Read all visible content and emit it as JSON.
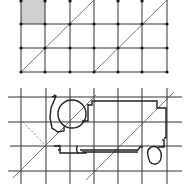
{
  "figure": {
    "width": 192,
    "height": 194,
    "background": "#ffffff",
    "stroke": "#2a2a2a",
    "thin_stroke": "#444444",
    "shade_fill": "#d0d0d0",
    "node_fill": "#1a1a1a"
  },
  "top_grid": {
    "x": [
      21,
      45,
      70,
      94,
      118,
      142,
      167
    ],
    "y": [
      0,
      24,
      48,
      72
    ],
    "shaded_cell": {
      "col": 0,
      "row": 0
    },
    "diagonals": [
      {
        "x1": 21,
        "y1": 72,
        "x2": 94,
        "y2": 0
      },
      {
        "x1": 94,
        "y1": 72,
        "x2": 167,
        "y2": 0
      }
    ]
  },
  "bottom_grid": {
    "x": [
      21,
      46,
      70,
      94,
      118,
      142,
      167
    ],
    "y": [
      97,
      122,
      146,
      171
    ],
    "x_extent": [
      8,
      182
    ],
    "y_extent": [
      88,
      184
    ],
    "diagonals": [
      {
        "x1": 13,
        "y1": 178,
        "x2": 96,
        "y2": 95
      },
      {
        "x1": 86,
        "y1": 180,
        "x2": 174,
        "y2": 92
      }
    ],
    "dashed_diagonal": {
      "x1": 23,
      "y1": 122,
      "x2": 46,
      "y2": 146
    }
  }
}
